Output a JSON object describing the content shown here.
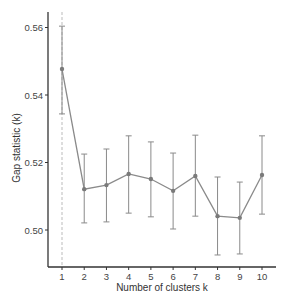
{
  "chart_data": {
    "type": "line",
    "title": "",
    "xlabel": "Number of clusters k",
    "ylabel": "Gap statistic (k)",
    "x": [
      1,
      2,
      3,
      4,
      5,
      6,
      7,
      8,
      9,
      10
    ],
    "x_tick_labels": [
      "1",
      "2",
      "3",
      "4",
      "5",
      "6",
      "7",
      "8",
      "9",
      "10"
    ],
    "y_ticks": [
      0.5,
      0.52,
      0.54,
      0.56
    ],
    "y_tick_labels": [
      "0.50",
      "0.52",
      "0.54",
      "0.56"
    ],
    "ylim": [
      0.4895,
      0.5635
    ],
    "xlim": [
      0.3,
      10.6
    ],
    "grid": false,
    "legend": null,
    "series": [
      {
        "name": "Gap statistic",
        "values": [
          0.5477,
          0.5121,
          0.5133,
          0.5166,
          0.5151,
          0.5116,
          0.516,
          0.5041,
          0.5036,
          0.5163
        ],
        "error_upper": [
          0.5604,
          0.5225,
          0.524,
          0.5279,
          0.5261,
          0.5228,
          0.5281,
          0.5157,
          0.5142,
          0.5279
        ],
        "error_lower": [
          0.5344,
          0.5021,
          0.5024,
          0.505,
          0.5039,
          0.5003,
          0.5041,
          0.4926,
          0.4929,
          0.5047
        ]
      }
    ],
    "annotations": [
      {
        "type": "vertical-dashed-line",
        "x": 1,
        "label": "optimal k"
      }
    ]
  },
  "colors": {
    "series": "#8a8a8a",
    "axis": "#333333",
    "vline": "#bbbbbb"
  }
}
